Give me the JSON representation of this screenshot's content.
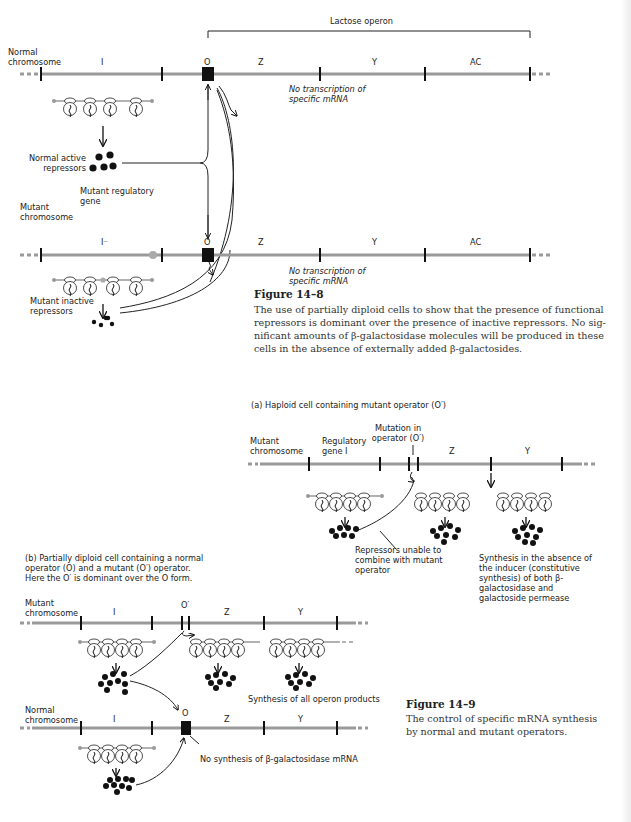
{
  "figure_14_8": {
    "operon_label": "Lactose operon",
    "normal_chromosome": {
      "label": "Normal chromosome",
      "genes": [
        "I",
        "O",
        "Z",
        "Y",
        "AC"
      ],
      "note": "No transcription of specific mRNA"
    },
    "normal_repressors_label": "Normal active repressors",
    "mutant_regulatory_gene_label": "Mutant regulatory gene",
    "mutant_chromosome": {
      "label": "Mutant chromosome",
      "genes": [
        "I⁻",
        "O",
        "Z",
        "Y",
        "AC"
      ],
      "note": "No transcription of specific mRNA"
    },
    "mutant_repressors_label": "Mutant inactive repressors",
    "caption": {
      "title": "Figure 14–8",
      "lines": [
        "The use of partially diploid cells to show that the presence of functional",
        "repressors is dominant over the presence of inactive repressors. No sig-",
        "nificant amounts of β-galactosidase molecules will be produced in these",
        "cells in the absence of externally added β-galactosides."
      ]
    }
  },
  "figure_14_9": {
    "panel_a": {
      "title": "(a) Haploid cell containing mutant operator (O′)",
      "chromosome_label": "Mutant chromosome",
      "regulatory_gene_label": "Regulatory gene I",
      "mutation_label": "Mutation in operator (O′)",
      "genes": [
        "Z",
        "Y"
      ],
      "repressor_note": "Repressors unable to combine with mutant operator",
      "synthesis_note": "Synthesis in the absence of the inducer (constitutive synthesis) of both β-galactosidase and galactoside permease"
    },
    "panel_b": {
      "title_lines": [
        "(b)  Partially diploid cell containing a normal",
        "operator (O) and a mutant (O′) operator.",
        "Here the O′ is dominant over the O form."
      ],
      "mutant_chromosome": {
        "label": "Mutant chromosome",
        "genes": [
          "I",
          "O′",
          "Z",
          "Y"
        ],
        "note": "Synthesis of all operon products"
      },
      "normal_chromosome": {
        "label": "Normal chromosome",
        "genes": [
          "I",
          "O",
          "Z",
          "Y"
        ],
        "note": "No synthesis of β-galactosidase mRNA"
      }
    },
    "caption": {
      "title": "Figure 14–9",
      "lines": [
        "The control of specific mRNA synthesis",
        "by normal and mutant operators."
      ]
    }
  }
}
